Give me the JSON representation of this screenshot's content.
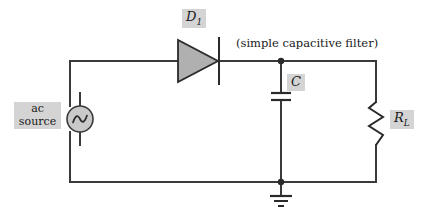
{
  "figure": {
    "type": "circuit-diagram",
    "background_color": "#ffffff",
    "wire_color": "#3a3a3a",
    "label_box_color": "#d4d4d4",
    "component_fill_color": "#b0b0b0"
  },
  "labels": {
    "diode": "D",
    "diode_subscript": "1",
    "capacitor": "C",
    "resistor": "R",
    "resistor_subscript": "L",
    "ac_source_line1": "ac",
    "ac_source_line2": "source",
    "filter_caption": "(simple capacitive filter)"
  },
  "components": [
    {
      "name": "ac-source",
      "symbol": "sine-wave-in-circle",
      "label": "ac source",
      "position": {
        "x": 80,
        "y": 119
      }
    },
    {
      "name": "diode",
      "symbol": "triangle-with-cathode-bar",
      "label": "D1",
      "orientation": "anode-left-cathode-right",
      "position": {
        "x": 198,
        "y": 61
      }
    },
    {
      "name": "capacitor",
      "symbol": "two-parallel-plates",
      "label": "C",
      "position": {
        "x": 281,
        "y": 96
      }
    },
    {
      "name": "load-resistor",
      "symbol": "zigzag",
      "label": "RL",
      "position": {
        "x": 376,
        "y": 123
      }
    },
    {
      "name": "ground",
      "symbol": "three-bar-ground",
      "position": {
        "x": 281,
        "y": 196
      }
    }
  ],
  "nodes": [
    {
      "name": "output-node",
      "x": 281,
      "y": 61
    },
    {
      "name": "ground-node",
      "x": 281,
      "y": 182
    }
  ],
  "wires": [
    {
      "name": "top-left-wire",
      "from": [
        70,
        61
      ],
      "to": [
        178,
        61
      ]
    },
    {
      "name": "top-right-wire",
      "from": [
        219,
        61
      ],
      "to": [
        376,
        61
      ]
    },
    {
      "name": "source-left-vertical",
      "from": [
        70,
        61
      ],
      "to": [
        70,
        182
      ]
    },
    {
      "name": "bottom-wire",
      "from": [
        70,
        182
      ],
      "to": [
        376,
        182
      ]
    },
    {
      "name": "capacitor-branch",
      "from": [
        281,
        61
      ],
      "to": [
        281,
        182
      ]
    },
    {
      "name": "resistor-branch",
      "from": [
        376,
        61
      ],
      "to": [
        376,
        182
      ]
    },
    {
      "name": "ground-lead",
      "from": [
        281,
        182
      ],
      "to": [
        281,
        196
      ]
    }
  ]
}
